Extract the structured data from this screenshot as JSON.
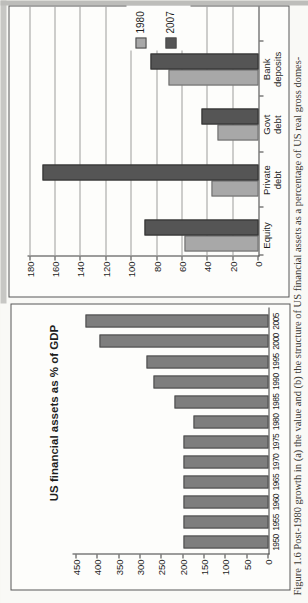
{
  "figure": {
    "caption": "Figure 1.6  Post-1980 growth in (a) the value and (b) the structure of US financial assets as a percentage of US real gross domes-"
  },
  "chart_data": [
    {
      "type": "bar",
      "panel": "a",
      "title": "US financial assets as % of GDP",
      "categories": [
        "1950",
        "1955",
        "1960",
        "1965",
        "1970",
        "1975",
        "1980",
        "1985",
        "1990",
        "1995",
        "2000",
        "2005"
      ],
      "values": [
        200,
        200,
        200,
        200,
        200,
        200,
        175,
        220,
        270,
        285,
        395,
        430
      ],
      "xlabel": "",
      "ylabel": "",
      "ylim": [
        0,
        450
      ],
      "ytick_step": 50,
      "grid": false,
      "legend": false,
      "bar_color": "#7e7e7e",
      "bar_border": "#4a4a4a"
    },
    {
      "type": "bar",
      "panel": "b",
      "title": "",
      "categories": [
        "Equity",
        "Private debt",
        "Govt debt",
        "Bank deposits"
      ],
      "series": [
        {
          "name": "1980",
          "values": [
            58,
            37,
            32,
            71
          ],
          "color": "#a8a8a8",
          "border": "#6a6a6a"
        },
        {
          "name": "2007",
          "values": [
            90,
            170,
            45,
            85
          ],
          "color": "#555555",
          "border": "#2f2f2f"
        }
      ],
      "ylim": [
        0,
        180
      ],
      "ytick_step": 20,
      "grid": true,
      "legend_position": "right-middle"
    }
  ]
}
